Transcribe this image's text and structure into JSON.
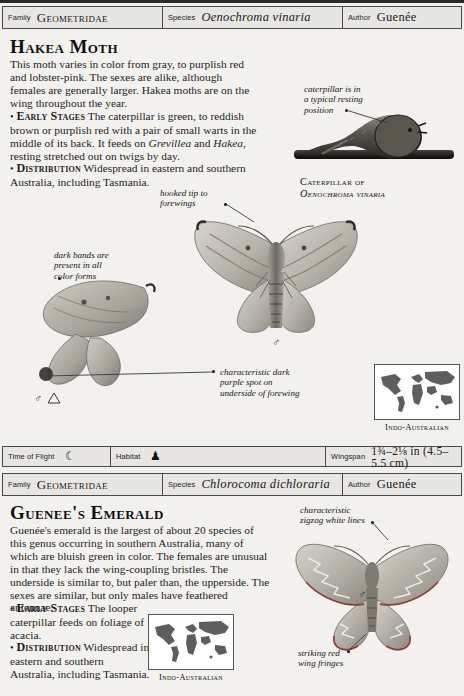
{
  "page": {
    "background": "#f3f1ed",
    "ink": "#1a1a1a"
  },
  "entries": [
    {
      "id": "hakea-moth",
      "header": {
        "family_key": "Family",
        "family_value": "Geometridae",
        "species_key": "Species",
        "species_value": "Oenochroma vinaria",
        "author_key": "Author",
        "author_value": "Guenée"
      },
      "title": "Hakea Moth",
      "intro": "This moth varies in color from gray, to purplish red and lobster-pink. The sexes are alike, although females are generally larger. Hakea moths are on the wing throughout the year.",
      "sections": [
        {
          "bullet": "•",
          "heading": "Early Stages",
          "text_before": " The caterpillar is green, to reddish brown or purplish red with a pair of small warts in the middle of its back. It feeds on ",
          "italic_1": "Grevillea",
          "text_mid": " and ",
          "italic_2": "Hakea",
          "text_after": ", resting stretched out on twigs by day."
        },
        {
          "bullet": "•",
          "heading": "Distribution",
          "text_before": " Widespread in eastern and southern Australia, including Tasmania.",
          "italic_1": "",
          "text_mid": "",
          "italic_2": "",
          "text_after": ""
        }
      ],
      "annotations": [
        {
          "name": "caterpillar-resting-note",
          "lines": [
            "caterpillar is in",
            "a typical resting",
            "position"
          ]
        },
        {
          "name": "hooked-tip-note",
          "lines": [
            "hooked tip to",
            "forewings"
          ]
        },
        {
          "name": "dark-bands-note",
          "lines": [
            "dark bands are",
            "present in all",
            "color forms"
          ]
        },
        {
          "name": "purple-spot-note",
          "lines": [
            "characteristic dark",
            "purple spot on",
            "underside of forewing"
          ]
        }
      ],
      "caption": {
        "line1": "Caterpillar of",
        "line2": "Oenochroma vinaria"
      },
      "map": {
        "label": "Indo-Australian"
      },
      "symbols": {
        "male": "♂",
        "female": "♀"
      },
      "infobar": {
        "time_of_flight_key": "Time of Flight",
        "time_of_flight_value": "☾",
        "habitat_key": "Habitat",
        "habitat_value": "♟",
        "wingspan_key": "Wingspan",
        "wingspan_value": "1¾–2⅛ in (4.5–5.5 cm)"
      }
    },
    {
      "id": "guenees-emerald",
      "header": {
        "family_key": "Family",
        "family_value": "Geometridae",
        "species_key": "Species",
        "species_value": "Chlorocoma dichloraria",
        "author_key": "Author",
        "author_value": "Guenée"
      },
      "title": "Guenee's Emerald",
      "intro": "Guenée's emerald is the largest of about 20 species of this genus occurring in southern Australia, many of which are bluish green in color. The females are unusual in that they lack the wing-coupling bristles. The underside is similar to, but paler than, the upperside. The sexes are similar, but only males have feathered antennae.",
      "sections": [
        {
          "bullet": "•",
          "heading": "Early Stages",
          "text_before": " The looper caterpillar feeds on foliage of acacia.",
          "italic_1": "",
          "text_mid": "",
          "italic_2": "",
          "text_after": ""
        },
        {
          "bullet": "•",
          "heading": "Distribution",
          "text_before": " Widespread in eastern and southern Australia, including Tasmania.",
          "italic_1": "",
          "text_mid": "",
          "italic_2": "",
          "text_after": ""
        }
      ],
      "annotations": [
        {
          "name": "zigzag-lines-note",
          "lines": [
            "characteristic",
            "zigzag white lines"
          ]
        },
        {
          "name": "red-fringes-note",
          "lines": [
            "striking red",
            "wing fringes"
          ]
        }
      ],
      "map": {
        "label": "Indo-Australian"
      },
      "symbols": {
        "male": "♂"
      }
    }
  ]
}
